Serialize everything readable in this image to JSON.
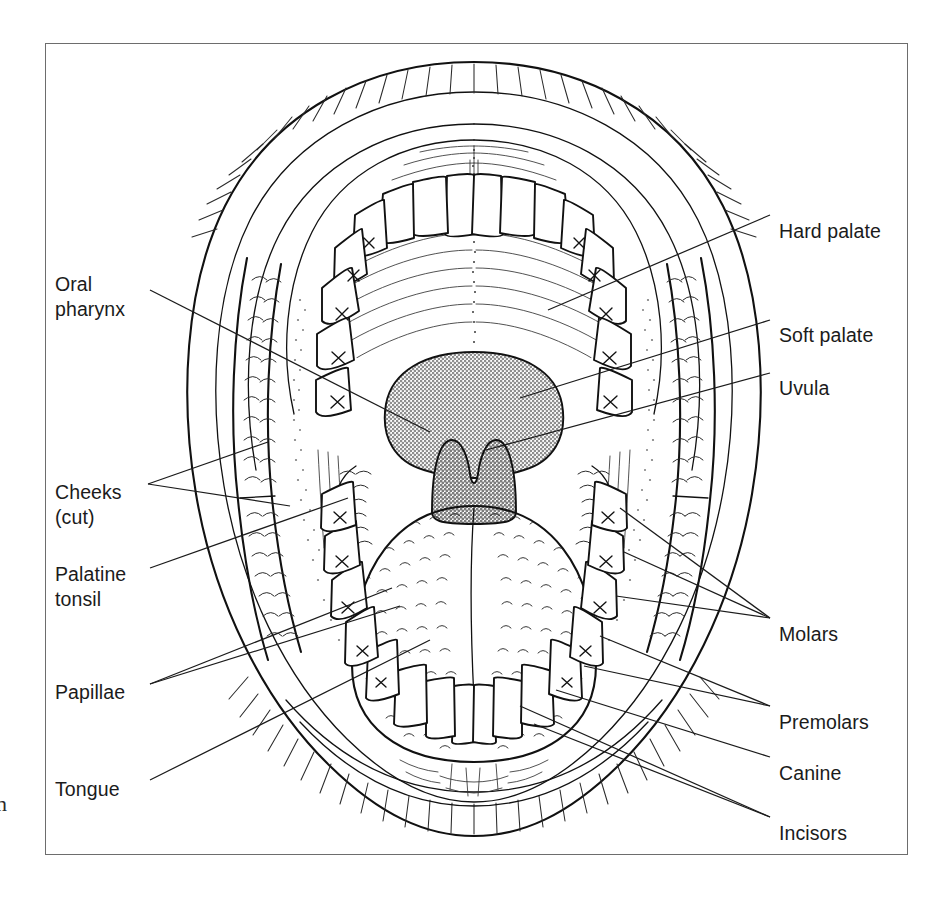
{
  "figure": {
    "margin_text": "n"
  },
  "colors": {
    "line": "#111111",
    "frame": "#6d6d6d",
    "soft_palate_fill": "#a8a8a8",
    "uvula_fill": "#9a9a9a",
    "background": "#ffffff"
  },
  "labels": {
    "left": [
      {
        "id": "oral-pharynx",
        "text": "Oral\npharynx",
        "x": 55,
        "y": 272
      },
      {
        "id": "cheeks-cut",
        "text": "Cheeks\n(cut)",
        "x": 55,
        "y": 480
      },
      {
        "id": "palatine-tonsil",
        "text": "Palatine\ntonsil",
        "x": 55,
        "y": 562
      },
      {
        "id": "papillae",
        "text": "Papillae",
        "x": 55,
        "y": 680
      },
      {
        "id": "tongue",
        "text": "Tongue",
        "x": 55,
        "y": 777
      }
    ],
    "right": [
      {
        "id": "hard-palate",
        "text": "Hard palate",
        "x": 779,
        "y": 219
      },
      {
        "id": "soft-palate",
        "text": "Soft palate",
        "x": 779,
        "y": 323
      },
      {
        "id": "uvula",
        "text": "Uvula",
        "x": 779,
        "y": 376
      },
      {
        "id": "molars",
        "text": "Molars",
        "x": 779,
        "y": 622
      },
      {
        "id": "premolars",
        "text": "Premolars",
        "x": 779,
        "y": 710
      },
      {
        "id": "canine",
        "text": "Canine",
        "x": 779,
        "y": 761
      },
      {
        "id": "incisors",
        "text": "Incisors",
        "x": 779,
        "y": 821
      }
    ]
  },
  "structures": [
    {
      "name": "hard-palate",
      "description": "ridged anterior roof of mouth with transverse rugae and median raphe"
    },
    {
      "name": "soft-palate",
      "description": "gray shaded posterior roof of mouth"
    },
    {
      "name": "uvula",
      "description": "gray pendant with notched superior border"
    },
    {
      "name": "oral-pharynx",
      "description": "opening behind the soft palate"
    },
    {
      "name": "palatine-tonsil",
      "description": "scalloped tissue masses lateral to the tongue"
    },
    {
      "name": "tongue",
      "description": "central organ covered in papillae with median sulcus"
    },
    {
      "name": "papillae",
      "description": "small arc-shaped projections on the tongue surface"
    },
    {
      "name": "cheeks-cut",
      "description": "cut lateral cheek strips with scale texture"
    },
    {
      "name": "upper-lip",
      "description": "hatched superior lip border"
    },
    {
      "name": "lower-lip",
      "description": "hatched inferior lip border"
    }
  ],
  "teeth": {
    "upper": {
      "incisors": 4,
      "canines": 2,
      "premolars": 4,
      "molars": 6
    },
    "lower": {
      "incisors": 4,
      "canines": 2,
      "premolars": 4,
      "molars": 6
    }
  }
}
